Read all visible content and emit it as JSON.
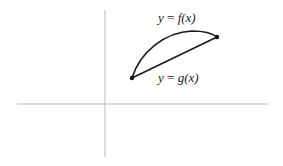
{
  "diagram": {
    "type": "function-region",
    "axes": {
      "x_axis": {
        "from": [
          17,
          104
        ],
        "to": [
          268,
          104
        ],
        "color": "#b8b8b8"
      },
      "y_axis": {
        "from": [
          105,
          10
        ],
        "to": [
          105,
          157
        ],
        "color": "#b8b8b8"
      }
    },
    "curves": [
      {
        "id": "f",
        "label": "y = f(x)",
        "label_parts": {
          "lhs": "y",
          "eq": " = ",
          "fn": "f",
          "arg": "(x)"
        },
        "shape": "concave-arc",
        "color": "#1a1a1a"
      },
      {
        "id": "g",
        "label": "y = g(x)",
        "label_parts": {
          "lhs": "y",
          "eq": " = ",
          "fn": "g",
          "arg": "(x)"
        },
        "shape": "line-segment",
        "color": "#1a1a1a"
      }
    ],
    "points": [
      {
        "id": "left-intersection",
        "x": 132,
        "y": 78
      },
      {
        "id": "right-intersection",
        "x": 217,
        "y": 37
      }
    ]
  }
}
